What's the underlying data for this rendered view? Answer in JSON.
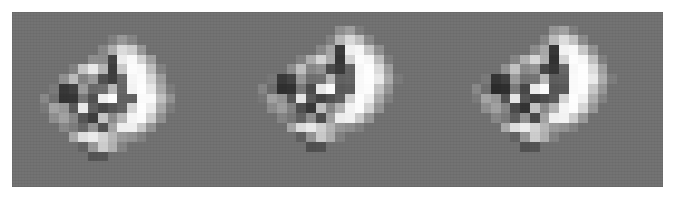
{
  "figure": {
    "background_color": "#ffffff",
    "canvas_color": "#6f6f6f",
    "canvas": {
      "x": 12,
      "y": 12,
      "width": 651,
      "height": 175
    },
    "panel_count": 3,
    "colormap": "grayscale",
    "value_range": [
      0,
      255
    ]
  },
  "chart_data": {
    "type": "heatmap",
    "subtitle": "",
    "xlabel": "",
    "ylabel": "",
    "colormap": "gray",
    "grid": false,
    "legend": "none",
    "vmin": 0,
    "vmax": 255,
    "background_value": 111,
    "cell_size_px": 9.7,
    "panels": [
      {
        "name": "panel-1",
        "label": "",
        "origin": {
          "x": 30,
          "y": 16
        },
        "cols": 17,
        "rows": 17,
        "values": [
          [
            111,
            111,
            111,
            111,
            111,
            111,
            111,
            111,
            111,
            111,
            111,
            111,
            111,
            111,
            111,
            111,
            111
          ],
          [
            111,
            111,
            111,
            111,
            111,
            111,
            111,
            111,
            111,
            111,
            111,
            111,
            111,
            111,
            111,
            111,
            111
          ],
          [
            111,
            111,
            111,
            111,
            111,
            111,
            111,
            111,
            126,
            150,
            131,
            111,
            111,
            111,
            111,
            111,
            111
          ],
          [
            111,
            111,
            111,
            111,
            111,
            111,
            111,
            133,
            172,
            219,
            205,
            150,
            111,
            111,
            111,
            111,
            111
          ],
          [
            111,
            111,
            111,
            111,
            111,
            111,
            140,
            138,
            66,
            236,
            249,
            210,
            158,
            111,
            111,
            111,
            111
          ],
          [
            111,
            111,
            111,
            111,
            128,
            196,
            233,
            179,
            60,
            200,
            252,
            248,
            189,
            128,
            111,
            111,
            111
          ],
          [
            111,
            111,
            111,
            142,
            186,
            130,
            151,
            79,
            62,
            103,
            246,
            252,
            214,
            155,
            111,
            111,
            111
          ],
          [
            111,
            111,
            120,
            54,
            63,
            152,
            103,
            108,
            182,
            100,
            243,
            254,
            231,
            168,
            122,
            111,
            111
          ],
          [
            111,
            134,
            111,
            50,
            52,
            116,
            79,
            238,
            253,
            96,
            96,
            251,
            250,
            190,
            143,
            111,
            111
          ],
          [
            111,
            120,
            162,
            150,
            89,
            233,
            94,
            72,
            86,
            98,
            213,
            254,
            236,
            167,
            123,
            111,
            111
          ],
          [
            111,
            111,
            141,
            160,
            133,
            84,
            60,
            196,
            138,
            181,
            245,
            251,
            205,
            143,
            111,
            111,
            111
          ],
          [
            111,
            111,
            111,
            134,
            122,
            101,
            145,
            82,
            163,
            238,
            239,
            198,
            146,
            111,
            111,
            111,
            111
          ],
          [
            111,
            111,
            111,
            111,
            167,
            222,
            235,
            210,
            181,
            152,
            144,
            128,
            111,
            111,
            111,
            111,
            111
          ],
          [
            111,
            111,
            111,
            111,
            111,
            98,
            150,
            204,
            175,
            130,
            111,
            111,
            111,
            111,
            111,
            111,
            111
          ],
          [
            111,
            111,
            111,
            111,
            111,
            111,
            82,
            84,
            111,
            111,
            111,
            111,
            111,
            111,
            111,
            111,
            111
          ],
          [
            111,
            111,
            111,
            111,
            111,
            111,
            111,
            111,
            111,
            111,
            111,
            111,
            111,
            111,
            111,
            111,
            111
          ],
          [
            111,
            111,
            111,
            111,
            111,
            111,
            111,
            111,
            111,
            111,
            111,
            111,
            111,
            111,
            111,
            111,
            111
          ]
        ]
      },
      {
        "name": "panel-2",
        "label": "",
        "origin": {
          "x": 248,
          "y": 16
        },
        "cols": 17,
        "rows": 17,
        "values": [
          [
            111,
            111,
            111,
            111,
            111,
            111,
            111,
            111,
            111,
            111,
            111,
            111,
            111,
            111,
            111,
            111,
            111
          ],
          [
            111,
            111,
            111,
            111,
            111,
            111,
            111,
            111,
            111,
            141,
            157,
            123,
            111,
            111,
            111,
            111,
            111
          ],
          [
            111,
            111,
            111,
            111,
            111,
            111,
            111,
            111,
            128,
            182,
            216,
            190,
            135,
            111,
            111,
            111,
            111
          ],
          [
            111,
            111,
            111,
            111,
            111,
            111,
            111,
            134,
            163,
            58,
            240,
            246,
            196,
            142,
            111,
            111,
            111
          ],
          [
            111,
            111,
            111,
            111,
            111,
            128,
            171,
            212,
            170,
            52,
            209,
            252,
            246,
            188,
            124,
            111,
            111
          ],
          [
            111,
            111,
            111,
            111,
            140,
            190,
            133,
            143,
            74,
            57,
            98,
            247,
            254,
            218,
            155,
            111,
            111
          ],
          [
            111,
            111,
            117,
            56,
            66,
            150,
            109,
            112,
            180,
            96,
            99,
            249,
            254,
            232,
            168,
            120,
            111
          ],
          [
            111,
            131,
            107,
            46,
            49,
            118,
            74,
            231,
            250,
            88,
            92,
            249,
            252,
            195,
            146,
            111,
            111
          ],
          [
            111,
            118,
            160,
            146,
            85,
            228,
            88,
            66,
            80,
            94,
            208,
            253,
            238,
            170,
            126,
            111,
            111
          ],
          [
            111,
            111,
            138,
            156,
            128,
            78,
            54,
            190,
            133,
            176,
            243,
            252,
            210,
            147,
            111,
            111,
            111
          ],
          [
            111,
            111,
            111,
            130,
            118,
            96,
            140,
            76,
            158,
            236,
            241,
            202,
            150,
            111,
            111,
            111,
            111
          ],
          [
            111,
            111,
            111,
            111,
            163,
            218,
            233,
            206,
            177,
            148,
            140,
            126,
            111,
            111,
            111,
            111,
            111
          ],
          [
            111,
            111,
            111,
            111,
            111,
            94,
            146,
            200,
            171,
            126,
            111,
            111,
            111,
            111,
            111,
            111,
            111
          ],
          [
            111,
            111,
            111,
            111,
            111,
            111,
            78,
            80,
            111,
            111,
            111,
            111,
            111,
            111,
            111,
            111,
            111
          ],
          [
            111,
            111,
            111,
            111,
            111,
            111,
            111,
            111,
            111,
            111,
            111,
            111,
            111,
            111,
            111,
            111,
            111
          ],
          [
            111,
            111,
            111,
            111,
            111,
            111,
            111,
            111,
            111,
            111,
            111,
            111,
            111,
            111,
            111,
            111,
            111
          ],
          [
            111,
            111,
            111,
            111,
            111,
            111,
            111,
            111,
            111,
            111,
            111,
            111,
            111,
            111,
            111,
            111,
            111
          ]
        ]
      },
      {
        "name": "panel-3",
        "label": "",
        "origin": {
          "x": 462,
          "y": 16
        },
        "cols": 17,
        "rows": 17,
        "values": [
          [
            111,
            111,
            111,
            111,
            111,
            111,
            111,
            111,
            111,
            111,
            111,
            111,
            111,
            111,
            111,
            111,
            111
          ],
          [
            111,
            111,
            111,
            111,
            111,
            111,
            111,
            111,
            111,
            147,
            160,
            126,
            111,
            111,
            111,
            111,
            111
          ],
          [
            111,
            111,
            111,
            111,
            111,
            111,
            111,
            111,
            132,
            186,
            220,
            193,
            138,
            111,
            111,
            111,
            111
          ],
          [
            111,
            111,
            111,
            111,
            111,
            111,
            111,
            138,
            166,
            54,
            243,
            248,
            199,
            145,
            111,
            111,
            111
          ],
          [
            111,
            111,
            111,
            111,
            111,
            131,
            174,
            215,
            173,
            48,
            212,
            253,
            247,
            191,
            127,
            111,
            111
          ],
          [
            111,
            111,
            111,
            111,
            143,
            193,
            136,
            146,
            70,
            53,
            101,
            248,
            254,
            220,
            158,
            111,
            111
          ],
          [
            111,
            111,
            120,
            52,
            62,
            153,
            112,
            115,
            183,
            92,
            95,
            250,
            254,
            234,
            171,
            123,
            111
          ],
          [
            111,
            134,
            110,
            42,
            45,
            121,
            70,
            234,
            251,
            84,
            88,
            250,
            253,
            198,
            149,
            111,
            111
          ],
          [
            111,
            121,
            163,
            149,
            81,
            231,
            84,
            62,
            76,
            90,
            211,
            254,
            240,
            173,
            129,
            111,
            111
          ],
          [
            111,
            111,
            141,
            159,
            131,
            74,
            50,
            193,
            136,
            179,
            245,
            253,
            213,
            150,
            111,
            111,
            111
          ],
          [
            111,
            111,
            111,
            133,
            121,
            92,
            143,
            72,
            161,
            239,
            243,
            205,
            153,
            111,
            111,
            111,
            111
          ],
          [
            111,
            111,
            111,
            111,
            166,
            221,
            236,
            209,
            180,
            151,
            143,
            129,
            111,
            111,
            111,
            111,
            111
          ],
          [
            111,
            111,
            111,
            111,
            111,
            97,
            149,
            203,
            174,
            129,
            111,
            111,
            111,
            111,
            111,
            111,
            111
          ],
          [
            111,
            111,
            111,
            111,
            111,
            111,
            80,
            82,
            111,
            111,
            111,
            111,
            111,
            111,
            111,
            111,
            111
          ],
          [
            111,
            111,
            111,
            111,
            111,
            111,
            111,
            111,
            111,
            111,
            111,
            111,
            111,
            111,
            111,
            111,
            111
          ],
          [
            111,
            111,
            111,
            111,
            111,
            111,
            111,
            111,
            111,
            111,
            111,
            111,
            111,
            111,
            111,
            111,
            111
          ],
          [
            111,
            111,
            111,
            111,
            111,
            111,
            111,
            111,
            111,
            111,
            111,
            111,
            111,
            111,
            111,
            111,
            111
          ]
        ]
      }
    ]
  }
}
